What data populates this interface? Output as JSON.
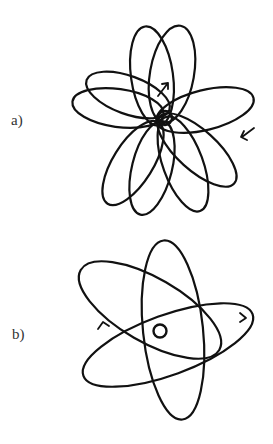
{
  "figure": {
    "panels": [
      {
        "label": "a)",
        "description": "Precessing rosette orbit: many elliptical loops around a central nucleus",
        "orbit_count": 9,
        "direction_arrows": 2
      },
      {
        "label": "b)",
        "description": "Three elliptical orbits around a central nucleus forming a flower pattern",
        "orbit_count": 3,
        "direction_arrows": 2
      }
    ],
    "colors": {
      "stroke": "#111111",
      "background": "#ffffff",
      "label": "#333333"
    }
  }
}
